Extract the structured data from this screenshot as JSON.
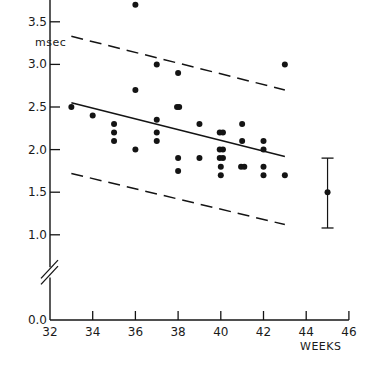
{
  "chart_data": {
    "type": "scatter",
    "title": "",
    "xlabel": "WEEKS",
    "ylabel": "msec",
    "xlim": [
      32,
      46
    ],
    "ylim": [
      0.0,
      4.0
    ],
    "y_axis_break": true,
    "grid": false,
    "legend": null,
    "x_ticks": [
      32,
      34,
      36,
      38,
      40,
      42,
      44,
      46
    ],
    "x_tick_labels": [
      "32",
      "34",
      "36",
      "38",
      "40",
      "42",
      "44",
      "46"
    ],
    "y_ticks": [
      0.0,
      1.0,
      1.5,
      2.0,
      2.5,
      3.0,
      3.5,
      4.0
    ],
    "y_tick_labels": [
      "0.0",
      "1.0",
      "1.5",
      "2.0",
      "2.5",
      "3.0",
      "3.5",
      "4.0"
    ],
    "series": [
      {
        "name": "observations",
        "type": "scatter",
        "points": [
          [
            33,
            2.5
          ],
          [
            34,
            2.4
          ],
          [
            35,
            2.3
          ],
          [
            35,
            2.2
          ],
          [
            35,
            2.1
          ],
          [
            36,
            3.7
          ],
          [
            36,
            2.7
          ],
          [
            36,
            2.0
          ],
          [
            37,
            3.0
          ],
          [
            37,
            2.35
          ],
          [
            37,
            2.2
          ],
          [
            37,
            2.1
          ],
          [
            38,
            2.9
          ],
          [
            37.95,
            2.5
          ],
          [
            38.05,
            2.5
          ],
          [
            38,
            1.9
          ],
          [
            38,
            1.75
          ],
          [
            39,
            2.3
          ],
          [
            39,
            1.9
          ],
          [
            39.95,
            2.2
          ],
          [
            40.1,
            2.2
          ],
          [
            39.95,
            2.0
          ],
          [
            40.1,
            2.0
          ],
          [
            39.95,
            1.9
          ],
          [
            40.1,
            1.9
          ],
          [
            40,
            1.8
          ],
          [
            40,
            1.7
          ],
          [
            41,
            2.3
          ],
          [
            41,
            2.1
          ],
          [
            40.95,
            1.8
          ],
          [
            41.1,
            1.8
          ],
          [
            42,
            2.1
          ],
          [
            42,
            2.0
          ],
          [
            42,
            1.8
          ],
          [
            42,
            1.7
          ],
          [
            43,
            3.0
          ],
          [
            43,
            1.7
          ]
        ]
      },
      {
        "name": "regression line",
        "type": "line",
        "style": "solid",
        "points": [
          [
            33,
            2.55
          ],
          [
            43,
            1.92
          ]
        ]
      },
      {
        "name": "upper limit",
        "type": "line",
        "style": "dashed",
        "points": [
          [
            33,
            3.33
          ],
          [
            43,
            2.7
          ]
        ]
      },
      {
        "name": "lower limit",
        "type": "line",
        "style": "dashed",
        "points": [
          [
            33,
            1.72
          ],
          [
            43,
            1.12
          ]
        ]
      },
      {
        "name": "term mean ± range",
        "type": "errorbar",
        "x": 45,
        "y": 1.5,
        "upper": 1.9,
        "lower": 1.08
      }
    ]
  }
}
